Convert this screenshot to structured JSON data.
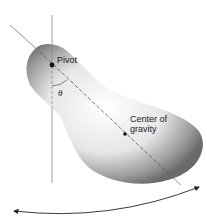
{
  "diagram": {
    "labels": {
      "pivot": "Pivot",
      "angle": "θ",
      "cg_line1": "Center of",
      "cg_line2": "gravity"
    },
    "colors": {
      "body_dark": "#6a6a6a",
      "body_light": "#ffffff",
      "line": "#777777",
      "dot": "#111111"
    }
  }
}
